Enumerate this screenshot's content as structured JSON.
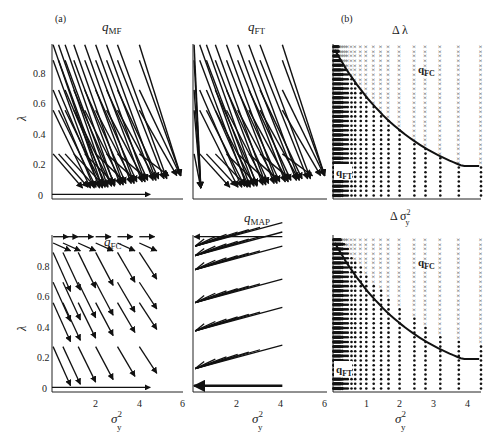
{
  "figure": {
    "panel_a_label": "(a)",
    "panel_b_label": "(b)",
    "ylabel": "λ",
    "xlabel_main": "σ",
    "xlabel_sup": "2",
    "xlabel_sub": "y"
  },
  "panels": {
    "q_mf": {
      "title_main": "q",
      "title_sub": "MF"
    },
    "q_ft": {
      "title_main": "q",
      "title_sub": "FT"
    },
    "delta_lambda": {
      "title": "Δ λ",
      "region_upper": "q",
      "region_upper_sub": "FC",
      "region_lower": "q",
      "region_lower_sub": "FT"
    },
    "q_fc": {
      "title_main": "q",
      "title_sub": "FC"
    },
    "q_map": {
      "title_main": "q",
      "title_sub": "MAP"
    },
    "delta_sigma": {
      "title_main": "Δ σ",
      "title_sup": "2",
      "title_sub": "y",
      "region_upper": "q",
      "region_upper_sub": "FC",
      "region_lower": "q",
      "region_lower_sub": "FT"
    }
  },
  "ticks": {
    "y": [
      "0",
      "0.2",
      "0.4",
      "0.6",
      "0.8"
    ],
    "x_a": [
      "2",
      "4",
      "6"
    ],
    "x_b": [
      "1",
      "2",
      "3",
      "4"
    ]
  },
  "chart_data": [
    {
      "type": "quiver",
      "title": "q_MF",
      "xlabel": "σ_y^2",
      "ylabel": "λ",
      "xlim": [
        0,
        6
      ],
      "ylim": [
        0,
        1
      ],
      "yticks": [
        0,
        0.2,
        0.4,
        0.6,
        0.8
      ],
      "description": "Vector field: arrows from grid points (σ²∈[0,4], λ∈{0.27,0.55,0.68,0.87,0.97}) pointing down-right toward λ≈0.05, σ²≈1–6"
    },
    {
      "type": "quiver",
      "title": "q_FT",
      "xlabel": "σ_y^2",
      "ylabel": "λ",
      "xlim": [
        0,
        6
      ],
      "ylim": [
        0,
        1
      ],
      "description": "Vector field similar to q_MF; arrows from small σ² point nearly straight down"
    },
    {
      "type": "scatter",
      "title": "Δ λ",
      "xlabel": "σ_y^2",
      "ylabel": "λ",
      "xlim": [
        0,
        4
      ],
      "ylim": [
        0,
        1
      ],
      "series": [
        {
          "name": "q_FC better (×)",
          "marker": "x"
        },
        {
          "name": "q_FT better (•)",
          "marker": "dot"
        }
      ],
      "boundary_curve": {
        "x": [
          0.1,
          0.5,
          1,
          1.5,
          2,
          2.5,
          3,
          3.5,
          4
        ],
        "y": [
          0.97,
          0.8,
          0.64,
          0.52,
          0.43,
          0.36,
          0.31,
          0.26,
          0.22
        ]
      }
    },
    {
      "type": "quiver",
      "title": "q_FC",
      "xlabel": "σ_y^2",
      "ylabel": "λ",
      "xlim": [
        0,
        6
      ],
      "ylim": [
        0,
        1
      ],
      "xticks": [
        2,
        4,
        6
      ],
      "yticks": [
        0,
        0.2,
        0.4,
        0.6,
        0.8
      ],
      "description": "Shorter arrows pointing down-right; at λ=0 and λ≈0.97 arrows point horizontally right"
    },
    {
      "type": "quiver",
      "title": "q_MAP",
      "xlabel": "σ_y^2",
      "xlim": [
        0,
        6
      ],
      "ylim": [
        0,
        1
      ],
      "xticks": [
        2,
        4,
        6
      ],
      "description": "Arrows fan from grid points toward σ²≈0 (left axis) with slight downward slope"
    },
    {
      "type": "scatter",
      "title": "Δ σ_y^2",
      "xlabel": "σ_y^2",
      "xlim": [
        0,
        4
      ],
      "ylim": [
        0,
        1
      ],
      "xticks": [
        1,
        2,
        3,
        4
      ],
      "series": [
        {
          "name": "q_FC better (×)",
          "marker": "x"
        },
        {
          "name": "q_FT better (•)",
          "marker": "dot"
        }
      ],
      "boundary_curve": {
        "x": [
          0.1,
          0.5,
          1,
          1.5,
          2,
          2.5,
          3,
          3.5,
          4
        ],
        "y": [
          0.97,
          0.8,
          0.64,
          0.52,
          0.43,
          0.36,
          0.31,
          0.26,
          0.22
        ]
      }
    }
  ]
}
